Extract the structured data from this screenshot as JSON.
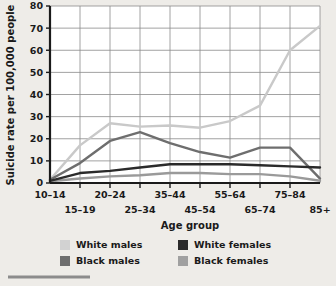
{
  "chart_data": {
    "type": "line",
    "title": "",
    "xlabel": "Age group",
    "ylabel": "Suicide rate per 100,000 people",
    "categories": [
      "10–14",
      "15–19",
      "20–24",
      "25–34",
      "35–44",
      "45–54",
      "55–64",
      "65–74",
      "75–84",
      "85+"
    ],
    "ylim": [
      0,
      80
    ],
    "yticks": [
      0,
      10,
      20,
      30,
      40,
      50,
      60,
      70,
      80
    ],
    "ytick_labels": [
      "0",
      "10",
      "20",
      "30",
      "40",
      "50",
      "60",
      "70",
      "80"
    ],
    "grid": true,
    "legend_position": "bottom",
    "series": [
      {
        "name": "White males",
        "color": "#c9c9c9",
        "values": [
          1.5,
          17,
          27,
          25.5,
          26,
          25,
          28,
          35,
          60,
          71
        ]
      },
      {
        "name": "Black males",
        "color": "#6e6e6e",
        "values": [
          1.5,
          9,
          19,
          23,
          18,
          14,
          11.5,
          16,
          16,
          2
        ]
      },
      {
        "name": "White females",
        "color": "#2b2b2b",
        "values": [
          1,
          4.5,
          5.5,
          7,
          8.5,
          8.5,
          8.5,
          8,
          7.5,
          7
        ]
      },
      {
        "name": "Black females",
        "color": "#9a9a9a",
        "values": [
          0.8,
          2,
          3,
          3.5,
          4.5,
          4.5,
          4,
          4,
          3,
          1
        ]
      }
    ]
  },
  "axes": {
    "y_axis_title": "Suicide rate per 100,000 people",
    "x_axis_title": "Age group",
    "x_labels_top": [
      "10–14",
      "20–24",
      "35–44",
      "55–64",
      "75–84"
    ],
    "x_labels_bottom": [
      "15–19",
      "25–34",
      "45–54",
      "65–74",
      "85+"
    ]
  },
  "legend": {
    "entries": [
      {
        "label": "White males",
        "color": "#d2d2d2"
      },
      {
        "label": "White females",
        "color": "#2b2b2b"
      },
      {
        "label": "Black males",
        "color": "#6e6e6e"
      },
      {
        "label": "Black females",
        "color": "#a0a0a0"
      }
    ]
  },
  "colors": {
    "background": "#eeece8",
    "plot_background": "#ffffff",
    "grid": "#8a8a8a",
    "axis": "#1a1a1a",
    "rule": "#8c8c8c"
  }
}
